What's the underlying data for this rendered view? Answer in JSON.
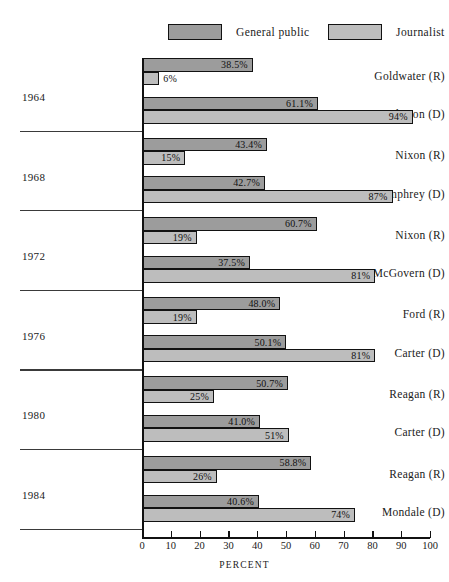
{
  "legend": {
    "items": [
      {
        "label": "General public",
        "color": "#9c9c9c",
        "name": "general-public"
      },
      {
        "label": "Journalist",
        "color": "#bdbdbd",
        "name": "journalist"
      }
    ]
  },
  "axis": {
    "title": "PERCENT",
    "ticks": [
      "0",
      "10",
      "20",
      "30",
      "40",
      "50",
      "60",
      "70",
      "80",
      "90",
      "100"
    ],
    "min": 0,
    "max": 100
  },
  "chart_data": {
    "type": "bar",
    "orientation": "horizontal",
    "title": "",
    "xlabel": "PERCENT",
    "ylabel": "",
    "xlim": [
      0,
      100
    ],
    "grid": false,
    "legend_position": "top",
    "series": [
      {
        "name": "General public",
        "color": "#9c9c9c"
      },
      {
        "name": "Journalist",
        "color": "#bdbdbd"
      }
    ],
    "groups": [
      {
        "year": "1964",
        "candidates": [
          {
            "label": "Goldwater (R)",
            "general_public": 38.5,
            "general_public_text": "38.5%",
            "journalist": 6,
            "journalist_text": "6%"
          },
          {
            "label": "Johnson (D)",
            "general_public": 61.1,
            "general_public_text": "61.1%",
            "journalist": 94,
            "journalist_text": "94%"
          }
        ]
      },
      {
        "year": "1968",
        "candidates": [
          {
            "label": "Nixon (R)",
            "general_public": 43.4,
            "general_public_text": "43.4%",
            "journalist": 15,
            "journalist_text": "15%"
          },
          {
            "label": "Humphrey (D)",
            "general_public": 42.7,
            "general_public_text": "42.7%",
            "journalist": 87,
            "journalist_text": "87%"
          }
        ]
      },
      {
        "year": "1972",
        "candidates": [
          {
            "label": "Nixon (R)",
            "general_public": 60.7,
            "general_public_text": "60.7%",
            "journalist": 19,
            "journalist_text": "19%"
          },
          {
            "label": "McGovern (D)",
            "general_public": 37.5,
            "general_public_text": "37.5%",
            "journalist": 81,
            "journalist_text": "81%"
          }
        ]
      },
      {
        "year": "1976",
        "candidates": [
          {
            "label": "Ford (R)",
            "general_public": 48.0,
            "general_public_text": "48.0%",
            "journalist": 19,
            "journalist_text": "19%"
          },
          {
            "label": "Carter (D)",
            "general_public": 50.1,
            "general_public_text": "50.1%",
            "journalist": 81,
            "journalist_text": "81%"
          }
        ]
      },
      {
        "year": "1980",
        "candidates": [
          {
            "label": "Reagan (R)",
            "general_public": 50.7,
            "general_public_text": "50.7%",
            "journalist": 25,
            "journalist_text": "25%"
          },
          {
            "label": "Carter (D)",
            "general_public": 41.0,
            "general_public_text": "41.0%",
            "journalist": 51,
            "journalist_text": "51%"
          }
        ]
      },
      {
        "year": "1984",
        "candidates": [
          {
            "label": "Reagan (R)",
            "general_public": 58.8,
            "general_public_text": "58.8%",
            "journalist": 26,
            "journalist_text": "26%"
          },
          {
            "label": "Mondale (D)",
            "general_public": 40.6,
            "general_public_text": "40.6%",
            "journalist": 74,
            "journalist_text": "74%"
          }
        ]
      }
    ]
  }
}
